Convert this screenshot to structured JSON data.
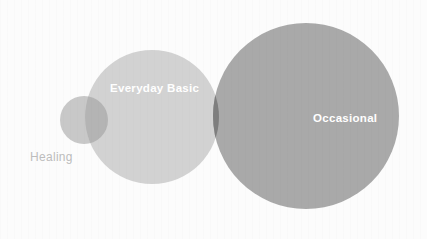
{
  "figure": {
    "type": "venn-bubble-diagram",
    "width": 427,
    "height": 239,
    "background_color": "#fcfcfc"
  },
  "chart_data": {
    "type": "venn",
    "title": "",
    "subtitle": "",
    "xlabel": "",
    "ylabel": "",
    "legend_position": "none",
    "grid": false,
    "sets": [
      {
        "label": "Healing",
        "cx": 84,
        "cy": 120,
        "r": 24,
        "fill": "#c8c8c8",
        "label_color": "#bdbdbd",
        "label_placement": "outside-below-left",
        "relative_size": 1
      },
      {
        "label": "Everyday Basic",
        "cx": 152,
        "cy": 117,
        "r": 67,
        "fill": "#d2d2d2",
        "label_color": "#ffffff",
        "label_placement": "inside-upper",
        "relative_size": 7.8
      },
      {
        "label": "Occasional",
        "cx": 306,
        "cy": 116,
        "r": 93,
        "fill": "#a9a9a9",
        "label_color": "#ffffff",
        "label_placement": "inside-right",
        "relative_size": 15.0
      }
    ],
    "intersections": [
      {
        "between": [
          "Healing",
          "Everyday Basic"
        ],
        "fill": "#b4b4b4",
        "label": ""
      },
      {
        "between": [
          "Everyday Basic",
          "Occasional"
        ],
        "fill": "#7e7e7e",
        "label": ""
      }
    ]
  },
  "labels": {
    "healing": "Healing",
    "everyday_basic": "Everyday Basic",
    "occasional": "Occasional"
  },
  "colors": {
    "small_circle": "#c8c8c8",
    "medium_circle": "#d2d2d2",
    "large_circle": "#a9a9a9",
    "overlap_small_medium": "#b4b4b4",
    "overlap_medium_large": "#7e7e7e",
    "label_light": "#bdbdbd",
    "label_white": "#ffffff",
    "background": "#fcfcfc"
  }
}
